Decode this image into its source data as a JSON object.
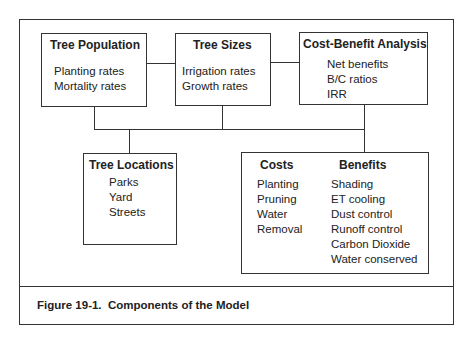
{
  "figure": {
    "caption": "Figure 19-1.  Components of the Model"
  },
  "boxes": {
    "tree_population": {
      "title": "Tree Population",
      "items": [
        "Planting rates",
        "Mortality rates"
      ]
    },
    "tree_sizes": {
      "title": "Tree Sizes",
      "items": [
        "Irrigation rates",
        "Growth rates"
      ]
    },
    "cost_benefit": {
      "title": "Cost-Benefit Analysis",
      "items": [
        "Net benefits",
        "B/C ratios",
        "IRR"
      ]
    },
    "tree_locations": {
      "title": "Tree Locations",
      "items": [
        "Parks",
        "Yard",
        "Streets"
      ]
    },
    "costs_benefits": {
      "costs_title": "Costs",
      "costs": [
        "Planting",
        "Pruning",
        "Water",
        "Removal"
      ],
      "benefits_title": "Benefits",
      "benefits": [
        "Shading",
        "ET cooling",
        "Dust control",
        "Runoff control",
        "Carbon Dioxide",
        "Water conserved"
      ]
    }
  }
}
